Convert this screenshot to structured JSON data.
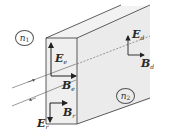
{
  "diagram": {
    "type": "electromagnetic wave reflection/transmission at interface of a slab",
    "media": [
      {
        "id": "n1",
        "symbol": "n",
        "subscript": "1"
      },
      {
        "id": "n2",
        "symbol": "n",
        "subscript": "2"
      }
    ],
    "vectors": [
      {
        "id": "E_e",
        "symbol": "E",
        "subscript": "e",
        "role": "incident electric field",
        "direction": "up"
      },
      {
        "id": "B_e",
        "symbol": "B",
        "subscript": "e",
        "role": "incident magnetic field",
        "direction": "right"
      },
      {
        "id": "E_r",
        "symbol": "E",
        "subscript": "r",
        "role": "reflected electric field",
        "direction": "down"
      },
      {
        "id": "B_r",
        "symbol": "B",
        "subscript": "r",
        "role": "reflected magnetic field",
        "direction": "right"
      },
      {
        "id": "E_d",
        "symbol": "E",
        "subscript": "d",
        "role": "transmitted electric field",
        "direction": "up"
      },
      {
        "id": "B_d",
        "symbol": "B",
        "subscript": "d",
        "role": "transmitted magnetic field",
        "direction": "right"
      }
    ],
    "colors": {
      "block_front": "#eeeeee",
      "block_side": "#e9e9e9",
      "block_top": "#f2f2f2",
      "line": "#333333"
    }
  }
}
